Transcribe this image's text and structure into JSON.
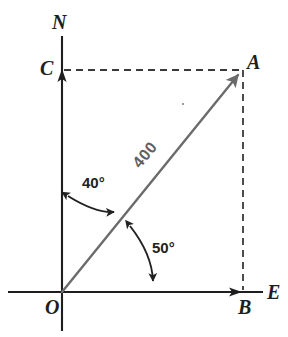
{
  "figure": {
    "points": {
      "origin": {
        "label": "O",
        "x": 62,
        "y": 292
      },
      "tip": {
        "label": "A",
        "x": 243,
        "y": 70
      },
      "east_foot": {
        "label": "B",
        "x": 243,
        "y": 292
      },
      "north_foot": {
        "label": "C",
        "x": 62,
        "y": 70
      }
    },
    "axes": {
      "north": {
        "label": "N",
        "x": 62,
        "y": 36,
        "color": "#1e1e1e"
      },
      "east": {
        "label": "E",
        "x": 263,
        "y": 292,
        "color": "#1e1e1e"
      }
    },
    "vector": {
      "magnitude_label": "400",
      "color": "#6b6b6b",
      "from": "O",
      "to": "A"
    },
    "angles": [
      {
        "name": "bearing-from-north",
        "label": "40°",
        "value": 40,
        "unit": "degrees",
        "from": "N-axis",
        "to": "vector",
        "color": "#222222"
      },
      {
        "name": "elevation-from-east",
        "label": "50°",
        "value": 50,
        "unit": "degrees",
        "from": "vector",
        "to": "E-axis",
        "color": "#222222"
      }
    ],
    "dashed_guides": [
      {
        "name": "north-component-guide",
        "from": "C",
        "to": "A"
      },
      {
        "name": "east-component-guide",
        "from": "A",
        "to": "B"
      }
    ],
    "colors": {
      "background": "#ffffff",
      "axis": "#1e1e1e",
      "vector": "#6b6b6b",
      "dashed": "#3a3a3a",
      "arc": "#222222",
      "text": "#1e1e1e",
      "magnitude_text": "#5f5f5f"
    }
  }
}
